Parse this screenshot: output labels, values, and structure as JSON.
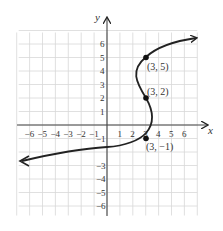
{
  "chart_data": {
    "type": "line",
    "title": "",
    "xlabel": "x",
    "ylabel": "y",
    "xlim": [
      -7,
      7
    ],
    "ylim": [
      -7,
      7
    ],
    "grid": true,
    "x_ticks": [
      "-6",
      "-5",
      "-4",
      "-3",
      "-2",
      "-1",
      "1",
      "2",
      "3",
      "4",
      "5",
      "6"
    ],
    "y_ticks": [
      "6",
      "5",
      "4",
      "3",
      "2",
      "1",
      "-1",
      "-3",
      "-4",
      "-5",
      "-6"
    ],
    "series": [
      {
        "name": "curve",
        "description": "S-shaped curve (x as function of y) with arrows at both ends",
        "points": [
          [
            -6.5,
            -2.7
          ],
          [
            -2,
            -2
          ],
          [
            0,
            -1.8
          ],
          [
            3,
            -1
          ],
          [
            3.8,
            0
          ],
          [
            3.6,
            1
          ],
          [
            3,
            2
          ],
          [
            2.2,
            3.5
          ],
          [
            3,
            5
          ],
          [
            6.3,
            6.3
          ]
        ]
      }
    ],
    "labeled_points": [
      {
        "x": 3,
        "y": 5,
        "label": "(3, 5)"
      },
      {
        "x": 3,
        "y": 2,
        "label": "(3, 2)"
      },
      {
        "x": 3,
        "y": -1,
        "label": "(3, −1)"
      }
    ]
  },
  "labels": {
    "x_axis": "x",
    "y_axis": "y",
    "p1": "(3, 5)",
    "p2": "(3, 2)",
    "p3": "(3, −1)"
  }
}
